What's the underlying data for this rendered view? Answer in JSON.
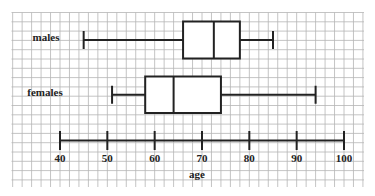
{
  "chart_data": {
    "type": "boxplot",
    "title": "",
    "xlabel": "age",
    "ylabel": "",
    "xlim": [
      40,
      100
    ],
    "x_ticks": [
      40,
      50,
      60,
      70,
      80,
      90,
      100
    ],
    "x_tick_labels": [
      "40",
      "50",
      "60",
      "70",
      "80",
      "90",
      "100"
    ],
    "grid": true,
    "grid_step": 2,
    "orientation": "horizontal",
    "series": [
      {
        "name": "males",
        "min": 45,
        "q1": 66,
        "median": 72.5,
        "q3": 78,
        "max": 85
      },
      {
        "name": "females",
        "min": 51,
        "q1": 58,
        "median": 64,
        "q3": 74,
        "max": 94
      }
    ],
    "colors": {
      "grid": "#b5b5b5",
      "ink": "#222222",
      "background": "#ffffff"
    }
  }
}
